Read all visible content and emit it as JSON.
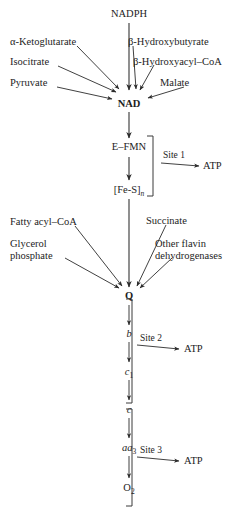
{
  "diagram": {
    "nodes": {
      "nadph": "NADPH",
      "nad": "NAD",
      "efmn": "E–FMN",
      "fes_main": "[Fe-S]",
      "fes_sub": "n",
      "q": "Q",
      "cyt_b": "b",
      "cyt_c1_main": "c",
      "cyt_c1_sub": "1",
      "cyt_c": "c",
      "cyt_aa3_main": "aa",
      "cyt_aa3_sub": "3",
      "o2_main": "O",
      "o2_sub": "2"
    },
    "nad_substrates_left": [
      "α-Ketoglutarate",
      "Isocitrate",
      "Pyruvate"
    ],
    "nad_substrates_right": [
      "β-Hydroxybutyrate",
      "β-Hydroxyacyl–CoA",
      "Malate"
    ],
    "q_substrates_left": [
      "Fatty acyl–CoA",
      "Glycerol",
      "phosphate"
    ],
    "q_substrates_right": [
      "Succinate",
      "Other flavin",
      "dehydrogenases"
    ],
    "sites": [
      {
        "label": "Site 1",
        "product": "ATP"
      },
      {
        "label": "Site 2",
        "product": "ATP"
      },
      {
        "label": "Site 3",
        "product": "ATP"
      }
    ],
    "colors": {
      "background": "#ffffff",
      "ink": "#1d1d1d",
      "stroke": "#2b2b2b"
    }
  }
}
